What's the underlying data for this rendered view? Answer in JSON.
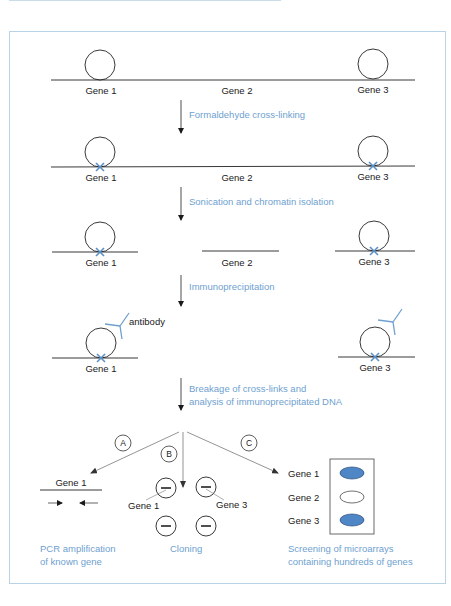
{
  "colors": {
    "frame": "#b9d3e6",
    "step_text": "#6f9fd0",
    "crosslink": "#5b8fc7",
    "antibody": "#6f9fd0",
    "spot_positive": "#4f86c6"
  },
  "row1": {
    "gene1": "Gene 1",
    "gene2": "Gene 2",
    "gene3": "Gene 3"
  },
  "step1": {
    "label": "Formaldehyde cross-linking"
  },
  "row2": {
    "gene1": "Gene 1",
    "gene2": "Gene 2",
    "gene3": "Gene 3"
  },
  "step2": {
    "label": "Sonication and chromatin isolation"
  },
  "row3": {
    "gene1": "Gene 1",
    "gene2": "Gene 2",
    "gene3": "Gene 3"
  },
  "step3": {
    "label": "Immunoprecipitation"
  },
  "row4": {
    "gene1": "Gene 1",
    "gene3": "Gene 3",
    "antibody_label": "antibody"
  },
  "step4": {
    "line1": "Breakage of cross-links and",
    "line2": "analysis of immunoprecipitated DNA"
  },
  "branches": {
    "a": {
      "letter": "A",
      "gene_label": "Gene 1",
      "caption_line1": "PCR amplification",
      "caption_line2": "of known gene"
    },
    "b": {
      "letter": "B",
      "clone_labels": [
        "Gene 1",
        "Gene 3"
      ],
      "caption": "Cloning"
    },
    "c": {
      "letter": "C",
      "microarray": [
        {
          "label": "Gene 1",
          "positive": true
        },
        {
          "label": "Gene 2",
          "positive": false
        },
        {
          "label": "Gene 3",
          "positive": true
        }
      ],
      "caption_line1": "Screening of microarrays",
      "caption_line2": "containing hundreds of genes"
    }
  }
}
